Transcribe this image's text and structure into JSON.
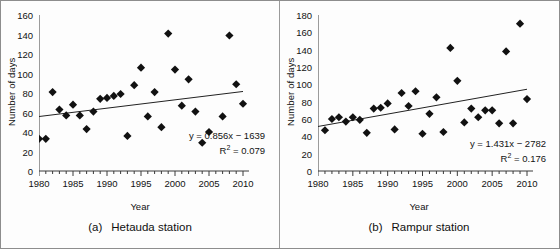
{
  "figure": {
    "y_axis_title": "Number of days",
    "x_axis_title": "Year"
  },
  "panels": [
    {
      "id": "a",
      "caption_label": "(a)",
      "caption_text": "Hetauda station",
      "equation": "y = 0.856x − 1639",
      "r2_prefix": "R",
      "r2_sup": "2",
      "r2_value": " = 0.079"
    },
    {
      "id": "b",
      "caption_label": "(b)",
      "caption_text": "Rampur station",
      "equation": "y = 1.431x − 2782",
      "r2_prefix": "R",
      "r2_sup": "2",
      "r2_value": " = 0.176"
    }
  ],
  "chart_data": [
    {
      "type": "scatter",
      "title": "(a) Hetauda station",
      "xlabel": "Year",
      "ylabel": "Number of days",
      "xlim": [
        1980,
        2010
      ],
      "ylim": [
        0,
        160
      ],
      "ytick_step": 20,
      "xticks": [
        1980,
        1985,
        1990,
        1995,
        2000,
        2005,
        2010
      ],
      "yticks": [
        0,
        20,
        40,
        60,
        80,
        100,
        120,
        140,
        160
      ],
      "xtick_labels": [
        "1980",
        "1985",
        "1990",
        "1995",
        "2000",
        "2005",
        "2010"
      ],
      "ytick_labels": [
        "0",
        "20",
        "40",
        "60",
        "80",
        "100",
        "120",
        "140",
        "160"
      ],
      "minor_xticks": true,
      "grid": false,
      "legend": "none",
      "marker": "diamond",
      "marker_color": "#111111",
      "trendline_color": "#222222",
      "annotations": [
        "y = 0.856x − 1639",
        "R² = 0.079"
      ],
      "trend": {
        "slope": 0.856,
        "intercept": -1639,
        "r2": 0.079
      },
      "x": [
        1980,
        1981,
        1982,
        1983,
        1984,
        1985,
        1986,
        1987,
        1988,
        1989,
        1990,
        1991,
        1992,
        1993,
        1994,
        1995,
        1996,
        1997,
        1998,
        1999,
        2000,
        2001,
        2002,
        2003,
        2004,
        2005,
        2007,
        2008,
        2009,
        2010
      ],
      "y": [
        33,
        33,
        81,
        63,
        57,
        68,
        57,
        43,
        61,
        74,
        75,
        77,
        79,
        36,
        88,
        106,
        56,
        81,
        45,
        141,
        104,
        67,
        94,
        61,
        29,
        40,
        56,
        139,
        89,
        69
      ]
    },
    {
      "type": "scatter",
      "title": "(b) Rampur station",
      "xlabel": "Year",
      "ylabel": "Number of days",
      "xlim": [
        1980,
        2010
      ],
      "ylim": [
        0,
        180
      ],
      "ytick_step": 20,
      "xticks": [
        1980,
        1985,
        1990,
        1995,
        2000,
        2005,
        2010
      ],
      "yticks": [
        0,
        20,
        40,
        60,
        80,
        100,
        120,
        140,
        160,
        180
      ],
      "xtick_labels": [
        "1980",
        "1985",
        "1990",
        "1995",
        "2000",
        "2005",
        "2010"
      ],
      "ytick_labels": [
        "0",
        "20",
        "40",
        "60",
        "80",
        "100",
        "120",
        "140",
        "160",
        "180"
      ],
      "minor_xticks": true,
      "grid": false,
      "legend": "none",
      "marker": "diamond",
      "marker_color": "#111111",
      "trendline_color": "#222222",
      "annotations": [
        "y = 1.431x − 2782",
        "R² = 0.176"
      ],
      "trend": {
        "slope": 1.431,
        "intercept": -2782,
        "r2": 0.176
      },
      "x": [
        1981,
        1982,
        1983,
        1984,
        1985,
        1986,
        1987,
        1988,
        1989,
        1990,
        1991,
        1992,
        1993,
        1994,
        1995,
        1996,
        1997,
        1998,
        1999,
        2000,
        2001,
        2002,
        2003,
        2004,
        2005,
        2006,
        2007,
        2008,
        2009,
        2010
      ],
      "y": [
        47,
        60,
        62,
        57,
        62,
        59,
        44,
        72,
        73,
        78,
        48,
        90,
        75,
        92,
        43,
        66,
        85,
        45,
        142,
        104,
        56,
        72,
        62,
        70,
        70,
        55,
        138,
        55,
        170,
        83
      ]
    }
  ]
}
